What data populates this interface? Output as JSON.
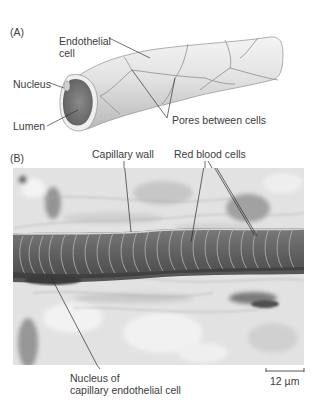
{
  "panel_a": {
    "label": "(A)",
    "title": "Capillary structure diagram",
    "labels": {
      "endothelial_line1": "Endothelial",
      "endothelial_line2": "cell",
      "nucleus": "Nucleus",
      "lumen": "Lumen",
      "pores": "Pores between cells"
    },
    "colors": {
      "tube_fill": "#e6e6e6",
      "tube_shadow": "#bdbdbd",
      "lumen_fill": "#7a7a7a",
      "cell_border": "#8a8a8a"
    }
  },
  "panel_b": {
    "label": "(B)",
    "title": "Micrograph of capillary",
    "labels": {
      "capillary_wall": "Capillary wall",
      "red_blood_cells": "Red blood cells",
      "nucleus_line1": "Nucleus of",
      "nucleus_line2": "capillary endothelial cell"
    },
    "scale_bar": {
      "value": "12 µm"
    },
    "colors": {
      "tissue_light": "#e4e4e4",
      "tissue_mid": "#b5b5b5",
      "vessel_dark": "#5a5a5a",
      "rbc_fill": "#6e6e6e"
    }
  }
}
